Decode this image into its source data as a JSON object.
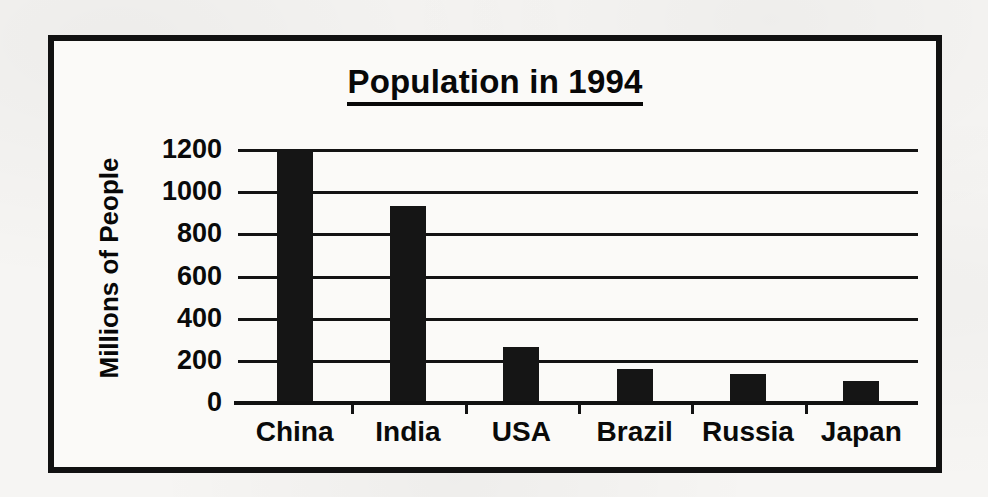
{
  "chart_data": {
    "type": "bar",
    "title": "Population in 1994",
    "xlabel": "",
    "ylabel": "Millions of People",
    "categories": [
      "China",
      "India",
      "USA",
      "Brazil",
      "Russia",
      "Japan"
    ],
    "values": [
      1200,
      930,
      260,
      155,
      135,
      100
    ],
    "ylim": [
      0,
      1200
    ],
    "ytick_values": [
      0,
      200,
      400,
      600,
      800,
      1000,
      1200
    ],
    "ytick_labels": [
      "0",
      "200",
      "400",
      "600",
      "800",
      "1000",
      "1200"
    ],
    "grid": true,
    "legend": null,
    "bar_color": "#151515",
    "axis_color": "#111111",
    "background_color": "#fbfaf8"
  },
  "page": {
    "background_color": "#f6f5f3",
    "border_color": "#111111"
  }
}
